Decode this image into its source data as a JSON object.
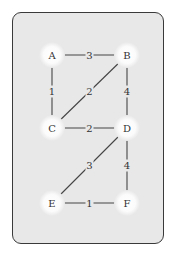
{
  "diagram": {
    "type": "weighted-undirected-graph",
    "colors": {
      "card_bg": "#e8e8e8",
      "card_border": "#3a3a3a",
      "node_fill": "#ffffff",
      "edge": "#444444",
      "text": "#333333"
    },
    "nodes": [
      {
        "id": "A",
        "label": "A",
        "x": 52,
        "y": 55
      },
      {
        "id": "B",
        "label": "B",
        "x": 127,
        "y": 55
      },
      {
        "id": "C",
        "label": "C",
        "x": 52,
        "y": 128
      },
      {
        "id": "D",
        "label": "D",
        "x": 127,
        "y": 128
      },
      {
        "id": "E",
        "label": "E",
        "x": 52,
        "y": 203
      },
      {
        "id": "F",
        "label": "F",
        "x": 127,
        "y": 203
      }
    ],
    "edges": [
      {
        "from": "A",
        "to": "B",
        "weight": "3"
      },
      {
        "from": "A",
        "to": "C",
        "weight": "1"
      },
      {
        "from": "B",
        "to": "C",
        "weight": "2"
      },
      {
        "from": "B",
        "to": "D",
        "weight": "4"
      },
      {
        "from": "C",
        "to": "D",
        "weight": "2"
      },
      {
        "from": "D",
        "to": "E",
        "weight": "3"
      },
      {
        "from": "D",
        "to": "F",
        "weight": "4"
      },
      {
        "from": "E",
        "to": "F",
        "weight": "1"
      }
    ]
  }
}
